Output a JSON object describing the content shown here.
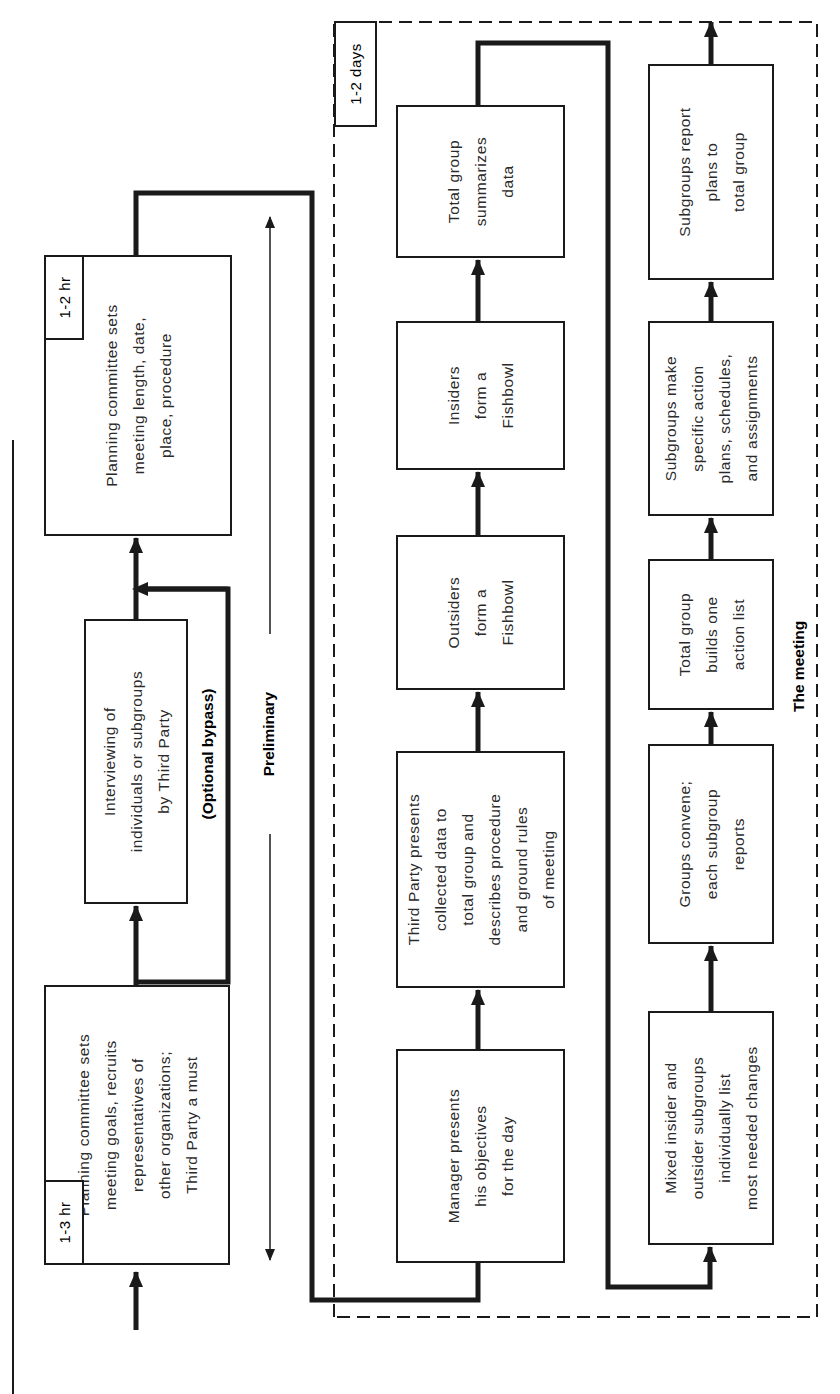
{
  "diagram": {
    "type": "flowchart",
    "orientation": "rotated-90-ccw",
    "sections": {
      "preliminary": {
        "label": "Preliminary",
        "bypass_label": "(Optional bypass)",
        "steps": [
          {
            "id": "p1",
            "duration": "1-3 hr",
            "text": "Planning committee sets\nmeeting goals, recruits\nrepresentatives of\nother organizations;\nThird Party a must"
          },
          {
            "id": "p2",
            "text": "Interviewing of\nindividuals or subgroups\nby Third Party"
          },
          {
            "id": "p3",
            "duration": "1-2 hr",
            "text": "Planning committee sets\nmeeting length, date,\nplace, procedure"
          }
        ]
      },
      "meeting": {
        "label": "The meeting",
        "duration": "1-2 days",
        "row1": [
          {
            "id": "m1",
            "text": "Manager presents\nhis objectives\nfor the day"
          },
          {
            "id": "m2",
            "text": "Third Party presents\ncollected data to\ntotal group and\ndescribes procedure\nand ground rules\nof meeting"
          },
          {
            "id": "m3",
            "text": "Outsiders\nform a\nFishbowl"
          },
          {
            "id": "m4",
            "text": "Insiders\nform a\nFishbowl"
          },
          {
            "id": "m5",
            "text": "Total group\nsummarizes\ndata"
          }
        ],
        "row2": [
          {
            "id": "m6",
            "text": "Mixed insider and\noutsider subgroups\nindividually list\nmost needed changes"
          },
          {
            "id": "m7",
            "text": "Groups convene;\neach subgroup\nreports"
          },
          {
            "id": "m8",
            "text": "Total group\nbuilds one\naction list"
          },
          {
            "id": "m9",
            "text": "Subgroups make\nspecific action\nplans, schedules,\nand assignments"
          },
          {
            "id": "m10",
            "text": "Subgroups report\nplans to\ntotal group"
          }
        ]
      }
    },
    "colors": {
      "ink": "#1a1a1a",
      "background": "#ffffff"
    }
  }
}
